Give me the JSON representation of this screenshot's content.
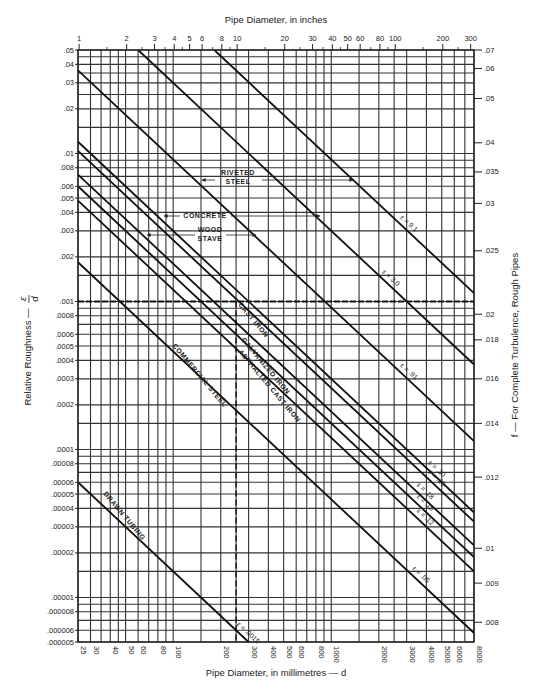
{
  "chart_data": {
    "type": "line",
    "top_axis": {
      "label": "Pipe Diameter, in inches",
      "scale": "log",
      "ticks": [
        "1",
        "2",
        "3",
        "4",
        "5",
        "6",
        "8",
        "10",
        "20",
        "30",
        "40",
        "50",
        "60",
        "80",
        "100",
        "200",
        "300"
      ]
    },
    "xlabel": "Pipe Diameter, in millimetres — d",
    "xscale": "log",
    "xlim": [
      25,
      8000
    ],
    "x_ticks": [
      "25",
      "30",
      "40",
      "50",
      "60",
      "80",
      "100",
      "200",
      "300",
      "400",
      "500",
      "600",
      "800",
      "1000",
      "2000",
      "3000",
      "4000",
      "5000",
      "6000",
      "8000"
    ],
    "ylabel": "Relative Roughness — ε/d",
    "yscale": "log",
    "ylim": [
      5e-06,
      0.05
    ],
    "y_ticks": [
      ".05",
      ".04",
      ".03",
      ".02",
      ".01",
      ".008",
      ".006",
      ".005",
      ".004",
      ".003",
      ".002",
      ".001",
      ".0008",
      ".0006",
      ".0005",
      ".0004",
      ".0003",
      ".0002",
      ".0001",
      ".00008",
      ".00006",
      ".00005",
      ".00004",
      ".00003",
      ".00002",
      ".00001",
      ".000008",
      ".000006",
      ".000005"
    ],
    "right_axis": {
      "label": "f — For Complete Turbulence, Rough Pipes",
      "ticks": [
        {
          "f": ".07",
          "rel_roughness": 0.05
        },
        {
          "f": ".06",
          "rel_roughness": 0.0375
        },
        {
          "f": ".05",
          "rel_roughness": 0.0235
        },
        {
          "f": ".04",
          "rel_roughness": 0.0118
        },
        {
          "f": ".035",
          "rel_roughness": 0.0075
        },
        {
          "f": ".03",
          "rel_roughness": 0.0046
        },
        {
          "f": ".025",
          "rel_roughness": 0.0022
        },
        {
          "f": ".02",
          "rel_roughness": 0.00082
        },
        {
          "f": ".018",
          "rel_roughness": 0.00055
        },
        {
          "f": ".016",
          "rel_roughness": 0.0003
        },
        {
          "f": ".014",
          "rel_roughness": 0.00015
        },
        {
          "f": ".012",
          "rel_roughness": 6.5e-05
        },
        {
          "f": ".01",
          "rel_roughness": 2.15e-05
        },
        {
          "f": ".009",
          "rel_roughness": 1.25e-05
        },
        {
          "f": ".008",
          "rel_roughness": 6.8e-06
        }
      ]
    },
    "grid": true,
    "series": [
      {
        "name": "ε = 9.1",
        "epsilon_mm": 9.1
      },
      {
        "name": "ε = 3.0",
        "epsilon_mm": 3.0
      },
      {
        "name": "ε = .91",
        "epsilon_mm": 0.91
      },
      {
        "name": "ε = .30",
        "epsilon_mm": 0.3
      },
      {
        "name": "ε = .26",
        "epsilon_mm": 0.26
      },
      {
        "name": "ε = .18",
        "epsilon_mm": 0.18
      },
      {
        "name": "ε = .15",
        "epsilon_mm": 0.15
      },
      {
        "name": "ε = .12",
        "epsilon_mm": 0.12
      },
      {
        "name": "ε = .05",
        "epsilon_mm": 0.046
      },
      {
        "name": "ε = .0015",
        "epsilon_mm": 0.0015
      }
    ],
    "material_annotations": [
      {
        "label": "RIVETED STEEL",
        "epsilon_range_mm": [
          0.91,
          9.1
        ]
      },
      {
        "label": "CONCRETE",
        "epsilon_range_mm": [
          0.3,
          3.0
        ]
      },
      {
        "label": "WOOD STAVE",
        "epsilon_range_mm": [
          0.18,
          0.91
        ]
      },
      {
        "label": "CAST IRON",
        "epsilon_mm": 0.26
      },
      {
        "label": "GALVANIZED IRON",
        "epsilon_mm": 0.15
      },
      {
        "label": "ASPHALTED CAST IRON",
        "epsilon_mm": 0.12
      },
      {
        "label": "COMMERCIAL STEEL",
        "epsilon_mm": 0.046
      },
      {
        "label": "DRAWN TUBING",
        "epsilon_mm": 0.0015
      }
    ],
    "reference_lines": {
      "horizontal_dashed_rel_roughness": 0.001,
      "vertical_dashed_diameter_mm": 250
    },
    "legend": "none"
  },
  "labels": {
    "top_title": "Pipe Diameter, in inches",
    "bottom_title": "Pipe Diameter, in millimetres — d",
    "left_title": "Relative Roughness —",
    "left_title_eps": "ε",
    "left_title_d": "d",
    "right_title": "f — For Complete Turbulence, Rough Pipes",
    "riveted_1": "RIVETED",
    "riveted_2": "STEEL",
    "concrete": "CONCRETE",
    "wood_1": "WOOD",
    "wood_2": "STAVE",
    "cast_iron": "CAST IRON",
    "galvanized": "GALVANIZED IRON",
    "asphalted": "ASPHALTED CAST IRON",
    "commercial": "COMMERCIAL STEEL",
    "drawn": "DRAWN TUBING"
  }
}
